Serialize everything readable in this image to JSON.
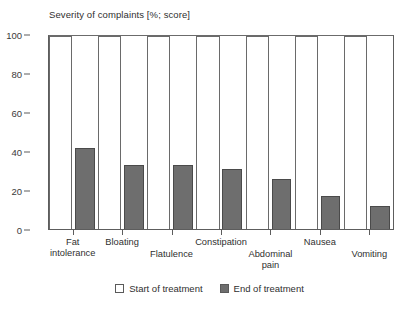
{
  "chart_data": {
    "type": "bar",
    "title": "Severity of complaints [%; score]",
    "xlabel": "",
    "ylabel": "",
    "ylim": [
      0,
      100
    ],
    "yticks": [
      0,
      20,
      40,
      60,
      80,
      100
    ],
    "grid": false,
    "legend_position": "bottom-center",
    "categories": [
      "Fat intolerance",
      "Bloating",
      "Flatulence",
      "Constipation",
      "Abdominal pain",
      "Nausea",
      "Vomiting"
    ],
    "category_lines": [
      [
        "Fat",
        "intolerance"
      ],
      [
        "Bloating"
      ],
      [
        "Flatulence"
      ],
      [
        "Constipation"
      ],
      [
        "Abdominal",
        "pain"
      ],
      [
        "Nausea"
      ],
      [
        "Vomiting"
      ]
    ],
    "category_label_rows": [
      "top",
      "top",
      "bottom",
      "top",
      "bottom",
      "top",
      "bottom"
    ],
    "series": [
      {
        "name": "Start of treatment",
        "color": "#ffffff",
        "values": [
          100,
          100,
          100,
          100,
          100,
          100,
          100
        ]
      },
      {
        "name": "End of treatment",
        "color": "#6e6e6e",
        "values": [
          42,
          33,
          33,
          31,
          26,
          17,
          12
        ]
      }
    ]
  },
  "legend": {
    "items": [
      {
        "label": "Start of treatment",
        "swatch": "fill-start"
      },
      {
        "label": "End of treatment",
        "swatch": "fill-end"
      }
    ]
  },
  "colors": {
    "bar_end_fill": "#6e6e6e",
    "bar_start_fill": "#ffffff",
    "axis": "#5d5d5d",
    "text": "#2f2f2f",
    "background": "#ffffff"
  }
}
